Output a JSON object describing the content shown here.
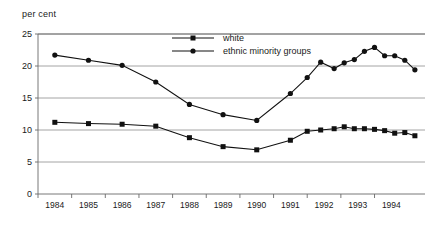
{
  "chart_data": {
    "type": "line",
    "title": "",
    "ylabel": "per cent",
    "xlabel": "",
    "ylim": [
      0,
      25
    ],
    "yticks": [
      0,
      5,
      10,
      15,
      20,
      25
    ],
    "categories": [
      "1984",
      "1985",
      "1986",
      "1987",
      "1988",
      "1989",
      "1990",
      "1991",
      "1992",
      "1993",
      "1994"
    ],
    "grid": true,
    "legend_position": "top-right",
    "series": [
      {
        "name": "white",
        "marker": "square",
        "points": [
          {
            "x": 1984.0,
            "y": 11.2
          },
          {
            "x": 1985.0,
            "y": 11.0
          },
          {
            "x": 1986.0,
            "y": 10.9
          },
          {
            "x": 1987.0,
            "y": 10.6
          },
          {
            "x": 1988.0,
            "y": 8.8
          },
          {
            "x": 1989.0,
            "y": 7.4
          },
          {
            "x": 1990.0,
            "y": 6.9
          },
          {
            "x": 1991.0,
            "y": 8.4
          },
          {
            "x": 1991.5,
            "y": 9.8
          },
          {
            "x": 1991.9,
            "y": 10.0
          },
          {
            "x": 1992.3,
            "y": 10.2
          },
          {
            "x": 1992.6,
            "y": 10.5
          },
          {
            "x": 1992.9,
            "y": 10.2
          },
          {
            "x": 1993.2,
            "y": 10.2
          },
          {
            "x": 1993.5,
            "y": 10.1
          },
          {
            "x": 1993.8,
            "y": 9.9
          },
          {
            "x": 1994.1,
            "y": 9.5
          },
          {
            "x": 1994.4,
            "y": 9.6
          },
          {
            "x": 1994.7,
            "y": 9.1
          }
        ]
      },
      {
        "name": "ethnic minority groups",
        "marker": "circle",
        "points": [
          {
            "x": 1984.0,
            "y": 21.7
          },
          {
            "x": 1985.0,
            "y": 20.9
          },
          {
            "x": 1986.0,
            "y": 20.1
          },
          {
            "x": 1987.0,
            "y": 17.5
          },
          {
            "x": 1988.0,
            "y": 14.0
          },
          {
            "x": 1989.0,
            "y": 12.4
          },
          {
            "x": 1990.0,
            "y": 11.5
          },
          {
            "x": 1991.0,
            "y": 15.7
          },
          {
            "x": 1991.5,
            "y": 18.2
          },
          {
            "x": 1991.9,
            "y": 20.6
          },
          {
            "x": 1992.3,
            "y": 19.6
          },
          {
            "x": 1992.6,
            "y": 20.5
          },
          {
            "x": 1992.9,
            "y": 21.0
          },
          {
            "x": 1993.2,
            "y": 22.3
          },
          {
            "x": 1993.5,
            "y": 22.9
          },
          {
            "x": 1993.8,
            "y": 21.6
          },
          {
            "x": 1994.1,
            "y": 21.6
          },
          {
            "x": 1994.4,
            "y": 20.9
          },
          {
            "x": 1994.7,
            "y": 19.4
          }
        ]
      }
    ]
  }
}
